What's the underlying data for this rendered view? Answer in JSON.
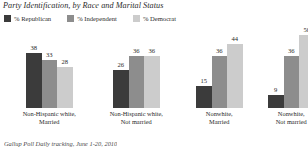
{
  "chart_data": {
    "type": "bar",
    "title": "Party Identification, by Race and Marital Status",
    "xlabel": "",
    "ylabel": "",
    "ylim": [
      0,
      55
    ],
    "grid": false,
    "legend_position": "top-left",
    "categories": [
      "Non-Hispanic white, Married",
      "Non-Hispanic white, Not married",
      "Nonwhite, Married",
      "Nonwhite, Not married"
    ],
    "category_lines": [
      [
        "Non-Hispanic white,",
        "Married"
      ],
      [
        "Non-Hispanic white,",
        "Not married"
      ],
      [
        "Nonwhite,",
        "Married"
      ],
      [
        "Nonwhite,",
        "Not married"
      ]
    ],
    "series": [
      {
        "name": "% Republican",
        "color": "#3b3b3b",
        "values": [
          38,
          26,
          15,
          9
        ]
      },
      {
        "name": "% Independent",
        "color": "#8d8d8d",
        "values": [
          33,
          36,
          36,
          36
        ]
      },
      {
        "name": "% Democrat",
        "color": "#cccccc",
        "values": [
          28,
          36,
          44,
          50
        ]
      }
    ],
    "source": "Gallup Poll Daily tracking, June 1-20, 2010"
  },
  "colors": {
    "republican": "#3b3b3b",
    "independent": "#8d8d8d",
    "democrat": "#cccccc",
    "text": "#2b2b2b",
    "background": "#ffffff"
  }
}
